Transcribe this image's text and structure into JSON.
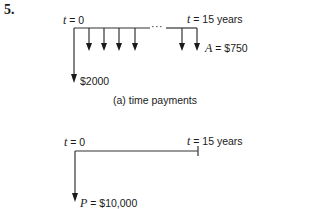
{
  "problem_number": "5.",
  "diagram_a": {
    "start_label_var": "t",
    "start_label_eq": " = 0",
    "end_label_var": "t",
    "end_label_eq": " = 15 years",
    "initial_payment_label": "$2000",
    "annuity_label_var": "A",
    "annuity_label_eq": " = $750",
    "ellipsis": "···",
    "caption": "(a) time payments"
  },
  "diagram_b": {
    "start_label_var": "t",
    "start_label_eq": " = 0",
    "end_label_var": "t",
    "end_label_eq": " = 15 years",
    "present_value_label_var": "P",
    "present_value_label_eq": " = $10,000"
  }
}
